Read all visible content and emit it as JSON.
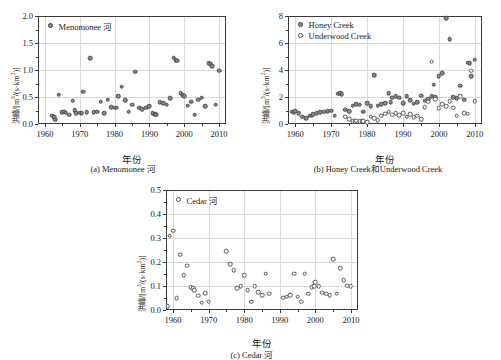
{
  "figure": {
    "axis_x_title": "年份",
    "axis_y_title_main": "洪峰",
    "axis_y_title_unit": "/[m³/(s·km²)]",
    "marker_fill_color": "#8a8a8a",
    "marker_edge_color": "#4a4a4a",
    "open_marker_color": "#ffffff",
    "frame_color": "#3a3a3a",
    "grid_color": "#d8d8d8"
  },
  "chart_data": [
    {
      "type": "scatter",
      "panel": "a",
      "caption": "(a) Menomonee 河",
      "title": "",
      "xlabel": "年份",
      "ylabel": "洪峰/[m³/(s·km²)]",
      "xlim": [
        1958,
        2012
      ],
      "ylim": [
        0.0,
        2.0
      ],
      "xticks": [
        1960,
        1970,
        1980,
        1990,
        2000,
        2010
      ],
      "yticks": [
        0.0,
        0.5,
        1.0,
        1.5,
        2.0
      ],
      "grid": true,
      "legend_position": "top-left",
      "series": [
        {
          "name": "Menomonee 河",
          "marker": "filled-circle",
          "x": [
            1962,
            1962.6,
            1963,
            1964,
            1965,
            1965.6,
            1966,
            1967,
            1968,
            1968.6,
            1969,
            1970,
            1970.6,
            1971,
            1972,
            1973,
            1974,
            1975,
            1976,
            1977,
            1978,
            1979,
            1980,
            1980.6,
            1981,
            1982,
            1983,
            1984,
            1985,
            1986,
            1987,
            1988,
            1989,
            1990,
            1991,
            1991.6,
            1992,
            1993,
            1994,
            1995,
            1996,
            1997,
            1997.6,
            1998,
            1999,
            1999.6,
            2000,
            2001,
            2002,
            2003,
            2004,
            2005,
            2006,
            2007,
            2007.6,
            2008,
            2009,
            2010
          ],
          "y": [
            0.15,
            0.13,
            0.08,
            0.54,
            0.22,
            0.23,
            0.21,
            0.17,
            0.43,
            0.26,
            0.2,
            0.21,
            0.2,
            0.6,
            0.22,
            1.22,
            0.22,
            0.23,
            0.41,
            0.2,
            0.45,
            0.31,
            0.3,
            0.3,
            0.52,
            0.69,
            0.44,
            0.23,
            0.36,
            0.97,
            0.3,
            0.27,
            0.3,
            0.33,
            0.2,
            0.18,
            0.17,
            0.4,
            0.38,
            0.36,
            0.48,
            1.23,
            1.18,
            1.17,
            0.57,
            0.53,
            0.52,
            0.34,
            0.41,
            0.17,
            0.45,
            0.49,
            0.33,
            1.13,
            1.11,
            1.07,
            0.36,
            0.99
          ]
        }
      ]
    },
    {
      "type": "scatter",
      "panel": "b",
      "caption": "(b) Honey Creek和Underwood Creek",
      "title": "",
      "xlabel": "年份",
      "ylabel": "洪峰/[m³/(s·km²)]",
      "xlim": [
        1958,
        2012
      ],
      "ylim": [
        0,
        8
      ],
      "xticks": [
        1960,
        1970,
        1980,
        1990,
        2000,
        2010
      ],
      "yticks": [
        0,
        2,
        4,
        6,
        8
      ],
      "grid": true,
      "legend_position": "top-left",
      "series": [
        {
          "name": "Honey Creek",
          "marker": "filled-circle",
          "x": [
            1959,
            1959.6,
            1960,
            1961,
            1962,
            1963,
            1964,
            1964.6,
            1965,
            1966,
            1967,
            1968,
            1969,
            1970,
            1971,
            1972,
            1972.6,
            1973,
            1974,
            1975,
            1976,
            1977,
            1978,
            1979,
            1980,
            1981,
            1982,
            1983,
            1984,
            1985,
            1986,
            1986.6,
            1987,
            1988,
            1989,
            1990,
            1991,
            1992,
            1993,
            1994,
            1995,
            1996,
            1997,
            1998,
            1998.6,
            1999,
            2000,
            2001,
            2002,
            2003,
            2004,
            2005,
            2006,
            2007,
            2008,
            2008.6,
            2009,
            2010
          ],
          "y": [
            0.9,
            0.85,
            0.95,
            0.8,
            0.55,
            0.45,
            0.6,
            0.62,
            0.72,
            0.78,
            0.88,
            0.9,
            0.95,
            0.98,
            0.62,
            2.25,
            2.3,
            2.22,
            1.05,
            0.95,
            1.35,
            1.45,
            1.42,
            0.9,
            1.52,
            1.3,
            3.6,
            1.35,
            1.45,
            1.55,
            2.28,
            1.6,
            1.95,
            2.05,
            1.95,
            1.55,
            2.05,
            1.75,
            1.5,
            1.62,
            2.1,
            1.72,
            1.85,
            2.05,
            2.9,
            1.98,
            3.55,
            3.75,
            7.85,
            6.3,
            2.0,
            1.92,
            2.85,
            1.8,
            4.55,
            4.5,
            3.55,
            4.75
          ]
        },
        {
          "name": "Underwood Creek",
          "marker": "open-circle",
          "x": [
            1974,
            1975,
            1976,
            1976.6,
            1977,
            1978,
            1978.6,
            1979,
            1980,
            1981,
            1982,
            1983,
            1984,
            1985,
            1986,
            1987,
            1988,
            1989,
            1990,
            1991,
            1992,
            1993,
            1994,
            1995,
            1996,
            1997,
            1998,
            1999,
            2000,
            2001,
            2002,
            2003,
            2004,
            2005,
            2006,
            2007,
            2008,
            2009,
            2010
          ],
          "y": [
            0.55,
            0.35,
            0.22,
            0.2,
            0.24,
            0.22,
            0.25,
            0.22,
            0.12,
            0.55,
            0.45,
            0.3,
            0.62,
            0.75,
            0.9,
            0.7,
            0.82,
            0.65,
            0.78,
            0.55,
            0.72,
            0.52,
            0.6,
            0.35,
            1.25,
            1.65,
            4.6,
            1.85,
            1.15,
            1.45,
            1.3,
            1.7,
            1.2,
            0.6,
            2.05,
            0.78,
            0.75,
            3.95,
            1.7
          ]
        }
      ]
    },
    {
      "type": "scatter",
      "panel": "c",
      "caption": "(c) Cedar 河",
      "title": "",
      "xlabel": "年份",
      "ylabel": "洪峰/[m³/(s·km²)]",
      "xlim": [
        1958,
        2012
      ],
      "ylim": [
        0.0,
        0.5
      ],
      "xticks": [
        1960,
        1970,
        1980,
        1990,
        2000,
        2010
      ],
      "yticks": [
        0.0,
        0.1,
        0.2,
        0.3,
        0.4,
        0.5
      ],
      "grid": true,
      "legend_position": "top-left",
      "series": [
        {
          "name": "Cedar 河",
          "marker": "open-circle",
          "x": [
            1958.5,
            1959,
            1960,
            1961,
            1962,
            1963,
            1964,
            1965,
            1965.6,
            1966,
            1967,
            1968,
            1969,
            1970,
            1975,
            1976,
            1977,
            1978,
            1979,
            1980,
            1981,
            1982,
            1983,
            1984,
            1985,
            1986,
            1987,
            1991,
            1992,
            1993,
            1994,
            1995,
            1996,
            1997,
            1998,
            1999,
            1999.6,
            2000,
            2001,
            2002,
            2003,
            2004,
            2005,
            2006,
            2007,
            2008,
            2009,
            2010
          ],
          "y": [
            0.015,
            0.31,
            0.33,
            0.05,
            0.23,
            0.145,
            0.185,
            0.095,
            0.09,
            0.082,
            0.06,
            0.03,
            0.07,
            0.035,
            0.245,
            0.19,
            0.165,
            0.09,
            0.1,
            0.145,
            0.082,
            0.035,
            0.098,
            0.075,
            0.062,
            0.152,
            0.068,
            0.052,
            0.055,
            0.062,
            0.152,
            0.055,
            0.035,
            0.152,
            0.068,
            0.095,
            0.1,
            0.115,
            0.1,
            0.072,
            0.068,
            0.062,
            0.212,
            0.068,
            0.175,
            0.125,
            0.102,
            0.098
          ]
        }
      ]
    }
  ]
}
